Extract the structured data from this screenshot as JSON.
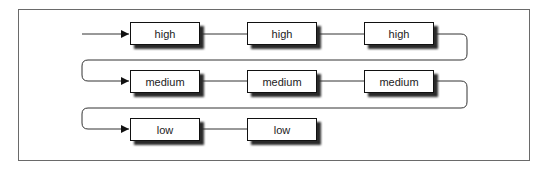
{
  "diagram": {
    "rows": [
      {
        "priority": "high",
        "nodes": [
          {
            "label": "high"
          },
          {
            "label": "high"
          },
          {
            "label": "high"
          }
        ]
      },
      {
        "priority": "medium",
        "nodes": [
          {
            "label": "medium"
          },
          {
            "label": "medium"
          },
          {
            "label": "medium"
          }
        ]
      },
      {
        "priority": "low",
        "nodes": [
          {
            "label": "low"
          },
          {
            "label": "low"
          }
        ]
      }
    ],
    "colors": {
      "line": "#333333",
      "frame": "#6a6a6a",
      "shadow": "#2a2a2a",
      "box_fill": "#ffffff"
    }
  }
}
